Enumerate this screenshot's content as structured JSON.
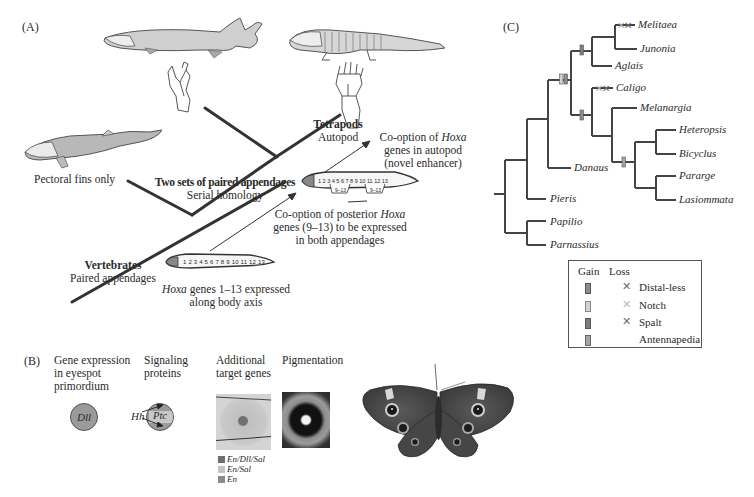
{
  "panelA": {
    "label": "(A)",
    "pectoral_fins": "Pectoral fins only",
    "tetrapods": {
      "title": "Tetrapods",
      "subtitle": "Autopod"
    },
    "two_sets": {
      "title": "Two sets of paired appendages",
      "subtitle": "Serial homology"
    },
    "vertebrates": {
      "title": "Vertebrates",
      "subtitle": "Paired appendages"
    },
    "hoxa_body": {
      "italic": "Hoxa",
      "line1_rest": " genes 1–13 expressed",
      "line2": "along body axis"
    },
    "cooption_posterior": {
      "line1_pre": "Co-option of posterior ",
      "line1_italic": "Hoxa",
      "line2": "genes (9–13) to be expressed",
      "line3": "in both appendages"
    },
    "cooption_autopod": {
      "line1_pre": "Co-option of ",
      "line1_italic": "Hoxa",
      "line2": "genes in autopod",
      "line3": "(novel enhancer)"
    },
    "gene_numbers": "1 2 3 4 5 6 7 8 9 10 11 12 13",
    "gene_block_label": "9–13"
  },
  "panelB": {
    "label": "(B)",
    "columns": [
      {
        "heading": [
          "Gene expression",
          "in eyespot",
          "primordium"
        ]
      },
      {
        "heading": [
          "Signaling",
          "proteins"
        ]
      },
      {
        "heading": [
          "Additional",
          "target genes"
        ]
      },
      {
        "heading": [
          "Pigmentation"
        ]
      }
    ],
    "dll_label": "Dll",
    "hh_label": "Hh",
    "ptc_label": "Ptc",
    "legend": [
      {
        "label": "En/Dll/Sal",
        "color": "#6e6e6e"
      },
      {
        "label": "En/Sal",
        "color": "#c4c4c4"
      },
      {
        "label": "En",
        "color": "#8a8a8a"
      }
    ]
  },
  "panelC": {
    "label": "(C)",
    "taxa": [
      "Melitaea",
      "Junonia",
      "Aglais",
      "Caligo",
      "Melanargia",
      "Danaus",
      "Heteropsis",
      "Bicyclus",
      "Pararge",
      "Lasiommata",
      "Pieris",
      "Papilio",
      "Parnassius"
    ],
    "legend": {
      "gain_header": "Gain",
      "loss_header": "Loss",
      "items": [
        {
          "label": "Distal-less",
          "gain_color": "#8c8c8c",
          "loss": true,
          "loss_color": "#6a6a6a"
        },
        {
          "label": "Notch",
          "gain_color": "#d2d2d2",
          "loss": true,
          "loss_color": "#b8b8b8"
        },
        {
          "label": "Spalt",
          "gain_color": "#7d7d7d",
          "loss": true,
          "loss_color": "#6a6a6a"
        },
        {
          "label": "Antennapedia",
          "gain_color": "#a5a5a5",
          "loss": false
        }
      ]
    }
  }
}
